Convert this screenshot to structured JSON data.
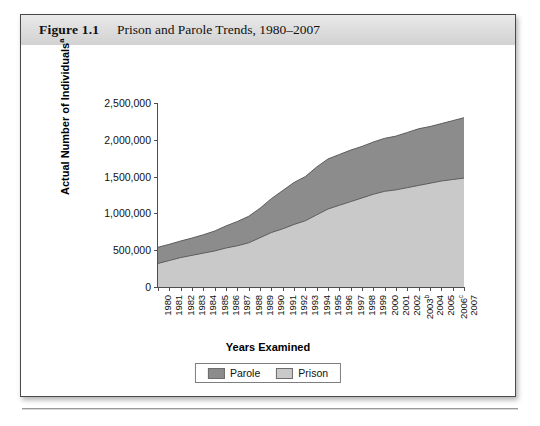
{
  "figure": {
    "number": "Figure 1.1",
    "title": "Prison and Parole Trends, 1980–2007"
  },
  "legend": {
    "items": [
      {
        "label": "Parole",
        "color": "#8c8c8c"
      },
      {
        "label": "Prison",
        "color": "#c9c9c9"
      }
    ]
  },
  "chart_data": {
    "type": "area",
    "stacked": true,
    "title": "Prison and Parole Trends, 1980–2007",
    "xlabel": "Years Examined",
    "ylabel": "Actual Number of Individuals",
    "ylabel_superscript": "a",
    "ylim": [
      0,
      2500000
    ],
    "yticks": [
      0,
      500000,
      1000000,
      1500000,
      2000000,
      2500000
    ],
    "ytick_labels": [
      "0",
      "500,000",
      "1,000,000",
      "1,500,000",
      "2,000,000",
      "2,500,000"
    ],
    "grid": false,
    "legend_position": "bottom",
    "categories": [
      "1980",
      "1981",
      "1982",
      "1983",
      "1984",
      "1985",
      "1986",
      "1987",
      "1988",
      "1989",
      "1990",
      "1991",
      "1992",
      "1993",
      "1994",
      "1995",
      "1996",
      "1997",
      "1998",
      "1999",
      "2000",
      "2001",
      "2002",
      "2003",
      "2004",
      "2005",
      "2006",
      "2007"
    ],
    "category_superscripts": {
      "2003": "b",
      "2006": "c"
    },
    "series": [
      {
        "name": "Prison",
        "color": "#c9c9c9",
        "values": [
          320000,
          360000,
          400000,
          430000,
          460000,
          490000,
          530000,
          560000,
          600000,
          670000,
          740000,
          790000,
          850000,
          900000,
          980000,
          1060000,
          1110000,
          1160000,
          1210000,
          1260000,
          1300000,
          1320000,
          1350000,
          1380000,
          1410000,
          1440000,
          1460000,
          1480000
        ]
      },
      {
        "name": "Parole",
        "color": "#8c8c8c",
        "values": [
          220000,
          220000,
          225000,
          235000,
          250000,
          270000,
          300000,
          330000,
          360000,
          400000,
          460000,
          520000,
          570000,
          600000,
          650000,
          680000,
          690000,
          700000,
          700000,
          710000,
          720000,
          730000,
          750000,
          770000,
          770000,
          780000,
          800000,
          820000
        ]
      }
    ],
    "totals": [
      540000,
      580000,
      625000,
      665000,
      710000,
      760000,
      830000,
      890000,
      960000,
      1070000,
      1200000,
      1310000,
      1420000,
      1500000,
      1630000,
      1740000,
      1800000,
      1860000,
      1910000,
      1970000,
      2020000,
      2050000,
      2100000,
      2150000,
      2180000,
      2220000,
      2260000,
      2300000
    ]
  }
}
